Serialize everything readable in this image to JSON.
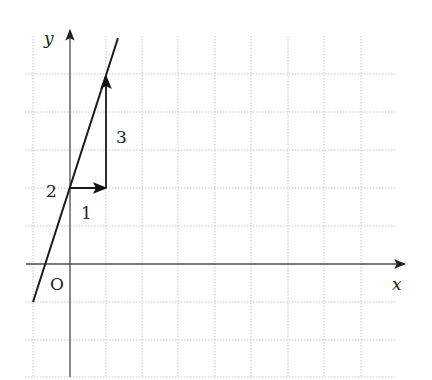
{
  "diagram": {
    "type": "coordinate-plane-line-graph",
    "axes": {
      "x_label": "x",
      "y_label": "y",
      "origin_label": "O"
    },
    "line": {
      "equation": "y = 3x + 2",
      "slope": 3,
      "y_intercept": 2
    },
    "annotations": {
      "intercept_label": "2",
      "run_label": "1",
      "rise_label": "3"
    },
    "colors": {
      "grid": "#b8b8b8",
      "axis": "#4a4a4a",
      "line": "#1a1a1a",
      "background": "#ffffff"
    }
  }
}
